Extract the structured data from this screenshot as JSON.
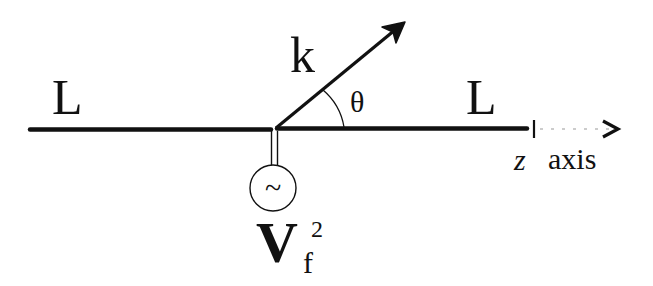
{
  "diagram": {
    "type": "antenna-geometry",
    "labels": {
      "left_segment": "L",
      "right_segment": "L",
      "wave_vector": "k",
      "angle": "θ",
      "axis_var": "z",
      "axis_word": "axis",
      "source_symbol": "~",
      "source_main": "V",
      "source_sub": "f",
      "source_sup": "2"
    },
    "colors": {
      "ink": "#111111",
      "background": "#ffffff"
    }
  }
}
